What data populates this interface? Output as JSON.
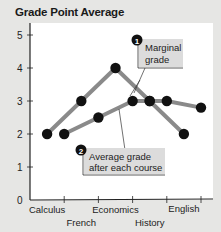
{
  "chart_data": {
    "type": "line",
    "title": "Grade Point Average",
    "xlabel": "",
    "ylabel": "",
    "ylim": [
      0,
      5
    ],
    "yticks": [
      0,
      1,
      2,
      3,
      4,
      5
    ],
    "categories": [
      "Calculus",
      "French",
      "Economics",
      "History",
      "English"
    ],
    "series": [
      {
        "name": "Marginal grade",
        "marker": "1",
        "x": [
          0.5,
          1.5,
          2.5,
          3.5,
          4.5
        ],
        "values": [
          2,
          3,
          4,
          3,
          2
        ]
      },
      {
        "name": "Average grade after each course",
        "marker": "2",
        "x": [
          1,
          2,
          3,
          3.5,
          4,
          5
        ],
        "values": [
          2,
          2.5,
          3,
          3,
          3,
          2.8
        ]
      }
    ],
    "grid": false,
    "legend": "inline callouts"
  },
  "title": "Grade Point Average",
  "callouts": [
    {
      "number": "1",
      "lines": [
        "Marginal",
        "grade"
      ]
    },
    {
      "number": "2",
      "lines": [
        "Average grade",
        "after each course"
      ]
    }
  ],
  "y_tick_labels": [
    "0",
    "1",
    "2",
    "3",
    "4",
    "5"
  ],
  "x_tick_labels": [
    "Calculus",
    "French",
    "Economics",
    "History",
    "English"
  ],
  "colors": {
    "background": "#e6e6e4",
    "plot_area": "#ffffff",
    "line": "#8a8a8a",
    "point": "#111111",
    "callout_box": "#dcdcdc"
  }
}
